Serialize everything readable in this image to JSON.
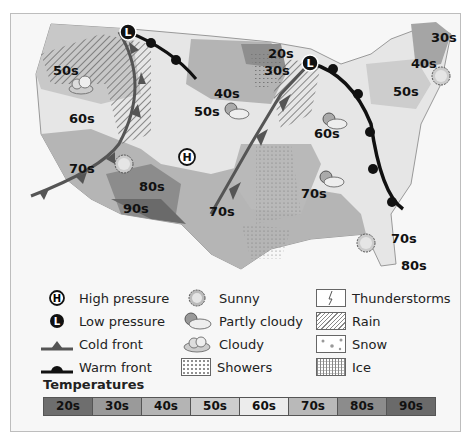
{
  "map": {
    "temperature_labels": [
      {
        "text": "50s",
        "x": 42,
        "y": 57
      },
      {
        "text": "60s",
        "x": 58,
        "y": 105
      },
      {
        "text": "70s",
        "x": 58,
        "y": 155
      },
      {
        "text": "80s",
        "x": 128,
        "y": 173
      },
      {
        "text": "90s",
        "x": 112,
        "y": 195
      },
      {
        "text": "40s",
        "x": 203,
        "y": 80
      },
      {
        "text": "50s",
        "x": 183,
        "y": 98
      },
      {
        "text": "30s",
        "x": 253,
        "y": 57
      },
      {
        "text": "20s",
        "x": 257,
        "y": 40
      },
      {
        "text": "60s",
        "x": 303,
        "y": 120
      },
      {
        "text": "70s",
        "x": 198,
        "y": 198
      },
      {
        "text": "70s",
        "x": 290,
        "y": 180
      },
      {
        "text": "50s",
        "x": 382,
        "y": 78
      },
      {
        "text": "40s",
        "x": 400,
        "y": 50
      },
      {
        "text": "30s",
        "x": 420,
        "y": 24
      },
      {
        "text": "70s",
        "x": 380,
        "y": 225
      },
      {
        "text": "80s",
        "x": 390,
        "y": 252
      }
    ],
    "pressure_markers": [
      {
        "type": "low",
        "label": "L",
        "x": 117,
        "y": 18
      },
      {
        "type": "low",
        "label": "L",
        "x": 299,
        "y": 49
      },
      {
        "type": "high",
        "label": "H",
        "x": 176,
        "y": 143
      }
    ],
    "weather_icons": [
      {
        "type": "cloudy",
        "x": 70,
        "y": 70
      },
      {
        "type": "sunny",
        "x": 113,
        "y": 150
      },
      {
        "type": "partly-cloudy",
        "x": 228,
        "y": 93
      },
      {
        "type": "partly-cloudy",
        "x": 325,
        "y": 95
      },
      {
        "type": "partly-cloudy",
        "x": 320,
        "y": 158
      },
      {
        "type": "sunny",
        "x": 360,
        "y": 223
      },
      {
        "type": "sunny",
        "x": 437,
        "y": 60
      }
    ]
  },
  "legend": {
    "items": [
      {
        "icon": "high-pressure",
        "label": "High pressure"
      },
      {
        "icon": "low-pressure",
        "label": "Low pressure"
      },
      {
        "icon": "cold-front",
        "label": "Cold front"
      },
      {
        "icon": "warm-front",
        "label": "Warm front"
      },
      {
        "icon": "sunny",
        "label": "Sunny"
      },
      {
        "icon": "partly-cloudy",
        "label": "Partly cloudy"
      },
      {
        "icon": "cloudy",
        "label": "Cloudy"
      },
      {
        "icon": "showers",
        "label": "Showers"
      },
      {
        "icon": "thunderstorms",
        "label": "Thunderstorms"
      },
      {
        "icon": "rain",
        "label": "Rain"
      },
      {
        "icon": "snow",
        "label": "Snow"
      },
      {
        "icon": "ice",
        "label": "Ice"
      }
    ],
    "high_symbol": "H",
    "low_symbol": "L"
  },
  "temperatures": {
    "title": "Temperatures",
    "scale": [
      {
        "label": "20s",
        "color": "#6e6e6e"
      },
      {
        "label": "30s",
        "color": "#9a9a9a"
      },
      {
        "label": "40s",
        "color": "#b4b4b4"
      },
      {
        "label": "50s",
        "color": "#cdcdcd"
      },
      {
        "label": "60s",
        "color": "#ececec"
      },
      {
        "label": "70s",
        "color": "#b9b9b9"
      },
      {
        "label": "80s",
        "color": "#8c8c8c"
      },
      {
        "label": "90s",
        "color": "#6a6a6a"
      }
    ]
  }
}
